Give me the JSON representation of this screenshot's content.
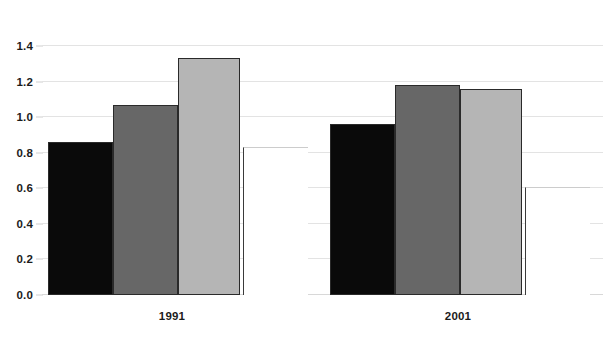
{
  "chart_data": {
    "type": "bar",
    "title": "",
    "subtitle": "",
    "xlabel": "",
    "ylabel": "",
    "categories": [
      "1991",
      "2001"
    ],
    "series": [
      {
        "name": "series-1",
        "color": "#0a0a0a",
        "values": [
          0.86,
          0.96
        ]
      },
      {
        "name": "series-2",
        "color": "#676767",
        "values": [
          1.07,
          1.18
        ]
      },
      {
        "name": "series-3",
        "color": "#b5b5b5",
        "values": [
          1.33,
          1.16
        ]
      },
      {
        "name": "series-4",
        "color": "#ffffff",
        "values": [
          0.83,
          0.61
        ]
      }
    ],
    "ylim": [
      0.0,
      1.4
    ],
    "yticks": [
      0.0,
      0.2,
      0.4,
      0.6,
      0.8,
      1.0,
      1.2,
      1.4
    ],
    "ytick_labels": [
      "0.0",
      "0.2",
      "0.4",
      "0.6",
      "0.8",
      "1.0",
      "1.2",
      "1.4"
    ],
    "grid": true,
    "grid_axis": "y",
    "legend": false,
    "legend_position": "none",
    "bar_group_gap": true,
    "annotations": []
  },
  "axis": {
    "y_tick_labels": [
      "1.4",
      "1.2",
      "1.0",
      "0.8",
      "0.6",
      "0.4",
      "0.2",
      "0.0"
    ],
    "x_group_labels": [
      "1991",
      "2001"
    ]
  }
}
